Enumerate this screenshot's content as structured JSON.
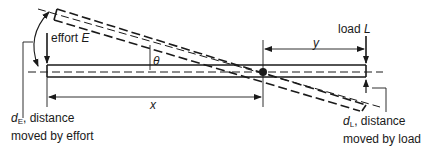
{
  "diagram": {
    "labels": {
      "effort_prefix": "effort ",
      "effort_symbol": "E",
      "load_prefix": "load ",
      "load_symbol": "L",
      "theta": "θ",
      "x": "x",
      "y": "y",
      "dE_symbol": "d",
      "dE_sub": "E",
      "dE_line1_rest": ", distance",
      "dE_line2": "moved by effort",
      "dL_symbol": "d",
      "dL_sub": "L",
      "dL_line1_rest": ", distance",
      "dL_line2": "moved by load"
    },
    "colors": {
      "line": "#1a1a1a",
      "background": "#ffffff"
    }
  }
}
